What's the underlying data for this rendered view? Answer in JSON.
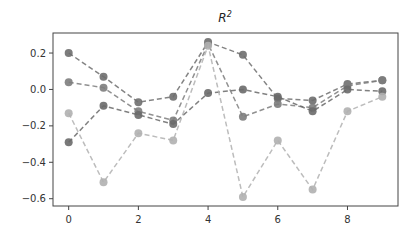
{
  "chart_data": {
    "type": "line",
    "title": "R",
    "title_superscript": "2",
    "xlabel": "",
    "ylabel": "",
    "x": [
      0,
      1,
      2,
      3,
      4,
      5,
      6,
      7,
      8,
      9
    ],
    "xlim": [
      -0.45,
      9.45
    ],
    "ylim": [
      -0.64,
      0.31
    ],
    "xticks": [
      0,
      2,
      4,
      6,
      8
    ],
    "yticks": [
      0.2,
      0.0,
      -0.2,
      -0.4,
      -0.6
    ],
    "ytick_labels": [
      "0.2",
      "0.0",
      "−0.2",
      "−0.4",
      "−0.6"
    ],
    "xtick_labels": [
      "0",
      "2",
      "4",
      "6",
      "8"
    ],
    "grid": false,
    "line_style": "dashed",
    "marker": "circle",
    "series": [
      {
        "name": "series-1",
        "color": "#6e6e6e",
        "values": [
          0.2,
          0.07,
          -0.07,
          -0.04,
          0.26,
          0.19,
          -0.05,
          -0.06,
          0.03,
          0.05
        ]
      },
      {
        "name": "series-2",
        "color": "#7d7d7d",
        "values": [
          0.04,
          0.01,
          -0.12,
          -0.17,
          0.25,
          -0.15,
          -0.08,
          -0.1,
          0.02,
          0.05
        ]
      },
      {
        "name": "series-3",
        "color": "#6a6a6a",
        "values": [
          -0.29,
          -0.09,
          -0.14,
          -0.19,
          -0.02,
          0.0,
          -0.04,
          -0.12,
          0.0,
          -0.01
        ]
      },
      {
        "name": "series-4",
        "color": "#b0b0b0",
        "values": [
          -0.13,
          -0.51,
          -0.24,
          -0.28,
          0.24,
          -0.59,
          -0.28,
          -0.55,
          -0.12,
          -0.04
        ]
      }
    ]
  }
}
